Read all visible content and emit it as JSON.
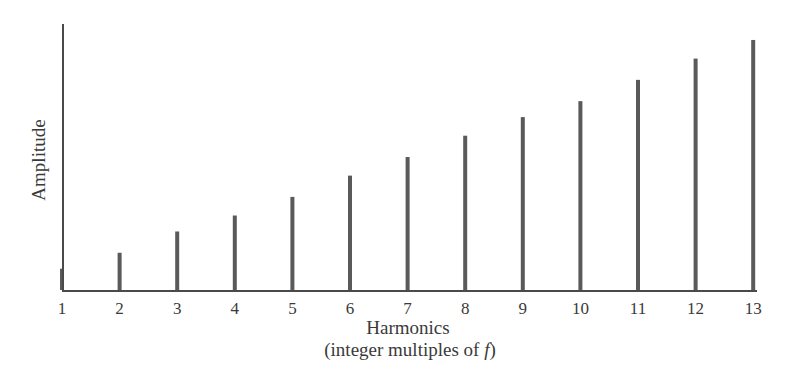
{
  "chart_data": {
    "type": "bar",
    "title": "",
    "xlabel": "Harmonics",
    "xlabel_sub": "(integer multiples of ",
    "xlabel_sub_var": "f",
    "xlabel_sub_end": ")",
    "ylabel": "Amplitude",
    "categories": [
      "1",
      "2",
      "3",
      "4",
      "5",
      "6",
      "7",
      "8",
      "9",
      "10",
      "11",
      "12",
      "13"
    ],
    "values": [
      0.08,
      0.14,
      0.22,
      0.28,
      0.35,
      0.43,
      0.5,
      0.58,
      0.65,
      0.71,
      0.79,
      0.87,
      0.94
    ],
    "ylim": [
      0,
      1
    ],
    "grid": false,
    "legend": "none",
    "colors": {
      "bar": "#5a5a5a",
      "axis": "#4a4a4a",
      "text": "#3a3a3a"
    }
  }
}
